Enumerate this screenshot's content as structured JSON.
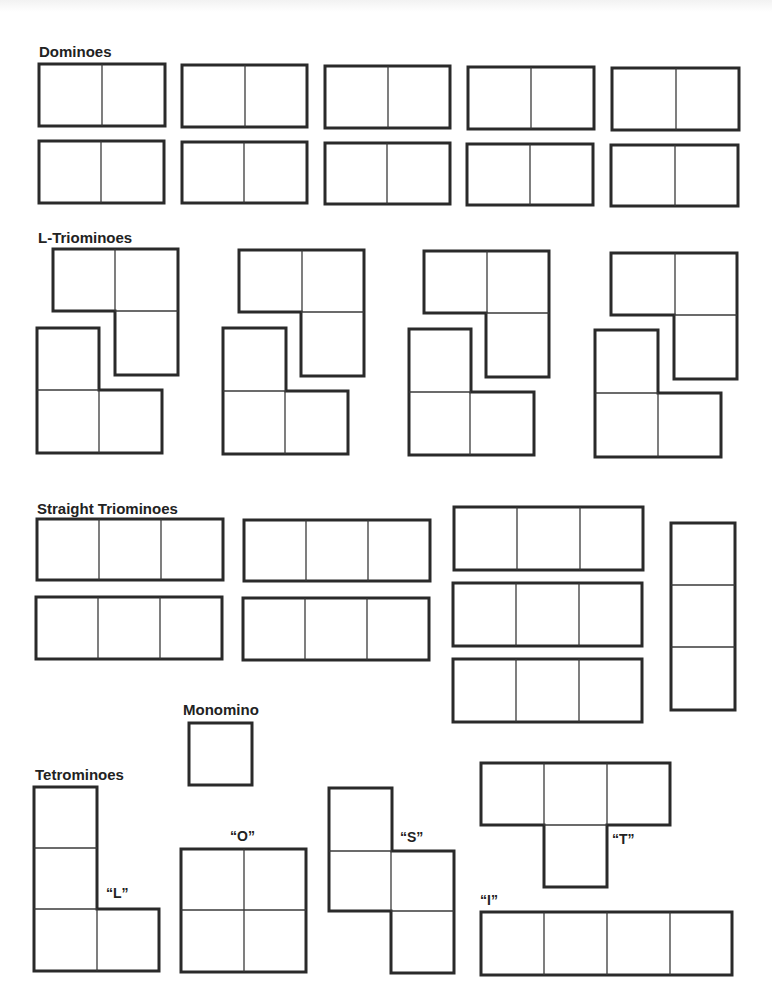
{
  "worksheet": {
    "sections": {
      "dominoes": {
        "label": "Dominoes",
        "count": 10
      },
      "l_triominoes": {
        "label": "L-Triominoes",
        "count": 8
      },
      "straight_triominoes": {
        "label": "Straight Triominoes",
        "count": 8
      },
      "monomino": {
        "label": "Monomino",
        "count": 1
      },
      "tetrominoes": {
        "label": "Tetrominoes",
        "pieces": [
          {
            "name": "L",
            "label": "“L”"
          },
          {
            "name": "O",
            "label": "“O”"
          },
          {
            "name": "S",
            "label": "“S”"
          },
          {
            "name": "T",
            "label": "“T”"
          },
          {
            "name": "I",
            "label": "“I”"
          }
        ]
      }
    },
    "colors": {
      "outline": "#2a2a2a",
      "inner_line": "#3a3a3a",
      "background": "#ffffff"
    }
  }
}
